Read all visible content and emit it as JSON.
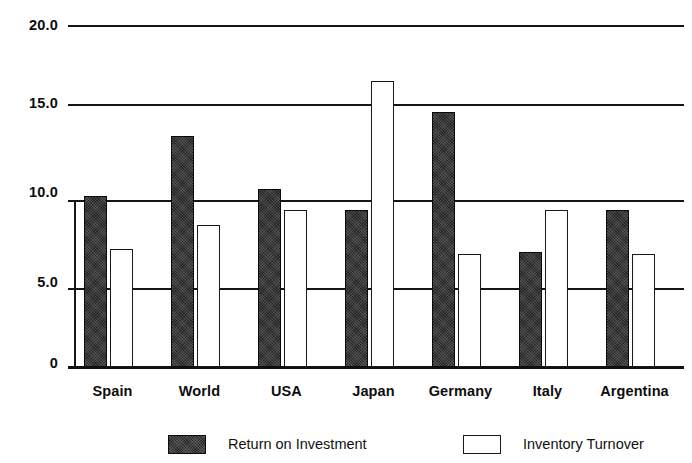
{
  "chart_data": {
    "type": "bar",
    "title": "",
    "xlabel": "",
    "ylabel": "",
    "categories": [
      "Spain",
      "World",
      "USA",
      "Japan",
      "Germany",
      "Italy",
      "Argentina"
    ],
    "series": [
      {
        "name": "Return on Investment",
        "swatch": "dark-filled",
        "color": "#232323",
        "values": [
          10.0,
          13.5,
          10.4,
          9.2,
          14.9,
          6.7,
          9.2
        ]
      },
      {
        "name": "Inventory Turnover",
        "swatch": "white-outlined",
        "color": "#ffffff",
        "values": [
          6.9,
          8.3,
          9.2,
          16.7,
          6.6,
          9.2,
          6.6
        ]
      }
    ],
    "ylim": [
      0,
      20
    ],
    "yticks": [
      0,
      5.0,
      10.0,
      15.0,
      20.0
    ],
    "ytick_labels": [
      "0",
      "5.0",
      "10.0",
      "15.0",
      "20.0"
    ],
    "grid": true,
    "grid_axis": "y",
    "legend_position": "bottom"
  },
  "axis": {
    "ticks": [
      {
        "label": "20.0",
        "value": 20
      },
      {
        "label": "15.0",
        "value": 15
      },
      {
        "label": "10.0",
        "value": 10
      },
      {
        "label": "5.0",
        "value": 5
      },
      {
        "label": "0",
        "value": 0
      }
    ]
  },
  "legend": {
    "items": [
      {
        "label": "Return on Investment",
        "style": "roi"
      },
      {
        "label": "Inventory Turnover",
        "style": "turnover"
      }
    ]
  }
}
